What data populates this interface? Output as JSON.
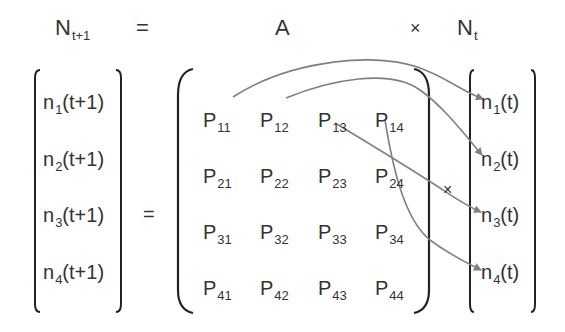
{
  "header": {
    "lhs": {
      "base": "N",
      "sub": "t+1"
    },
    "equals": "=",
    "matrix_name": "A",
    "times": "×",
    "rhs": {
      "base": "N",
      "sub": "t"
    }
  },
  "lhs_vector": [
    {
      "base": "n",
      "sub": "1",
      "tail": "(t+1)"
    },
    {
      "base": "n",
      "sub": "2",
      "tail": "(t+1)"
    },
    {
      "base": "n",
      "sub": "3",
      "tail": "(t+1)"
    },
    {
      "base": "n",
      "sub": "4",
      "tail": "(t+1)"
    }
  ],
  "equals": "=",
  "matrix": [
    [
      {
        "base": "P",
        "sub": "11"
      },
      {
        "base": "P",
        "sub": "12"
      },
      {
        "base": "P",
        "sub": "13"
      },
      {
        "base": "P",
        "sub": "14"
      }
    ],
    [
      {
        "base": "P",
        "sub": "21"
      },
      {
        "base": "P",
        "sub": "22"
      },
      {
        "base": "P",
        "sub": "23"
      },
      {
        "base": "P",
        "sub": "24"
      }
    ],
    [
      {
        "base": "P",
        "sub": "31"
      },
      {
        "base": "P",
        "sub": "32"
      },
      {
        "base": "P",
        "sub": "33"
      },
      {
        "base": "P",
        "sub": "34"
      }
    ],
    [
      {
        "base": "P",
        "sub": "41"
      },
      {
        "base": "P",
        "sub": "42"
      },
      {
        "base": "P",
        "sub": "43"
      },
      {
        "base": "P",
        "sub": "44"
      }
    ]
  ],
  "times": "×",
  "rhs_vector": [
    {
      "base": "n",
      "sub": "1",
      "tail": "(t)"
    },
    {
      "base": "n",
      "sub": "2",
      "tail": "(t)"
    },
    {
      "base": "n",
      "sub": "3",
      "tail": "(t)"
    },
    {
      "base": "n",
      "sub": "4",
      "tail": "(t)"
    }
  ],
  "arrows": [
    {
      "from": "P11",
      "to": "n1(t)"
    },
    {
      "from": "P12",
      "to": "n2(t)"
    },
    {
      "from": "P13",
      "to": "n3(t)"
    },
    {
      "from": "P14",
      "to": "n4(t)"
    }
  ],
  "colors": {
    "text": "#333333",
    "bracket": "#222222",
    "arrow": "#808080"
  }
}
